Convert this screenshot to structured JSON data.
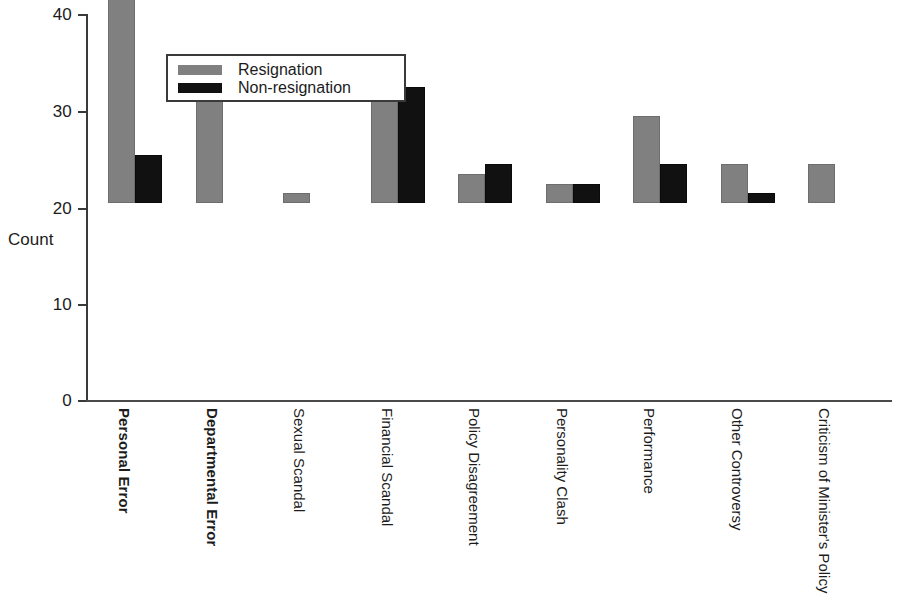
{
  "chart_data": {
    "type": "bar",
    "title": "",
    "xlabel": "",
    "ylabel": "Count",
    "ylim": [
      0,
      40
    ],
    "yticks": [
      0,
      10,
      20,
      30,
      40
    ],
    "grid": false,
    "legend_position": "top-left-inside",
    "categories": [
      "Personal Error",
      "Departmental Error",
      "Sexual Scandal",
      "Financial Scandal",
      "Policy Disagreement",
      "Personality Clash",
      "Performance",
      "Other Controversy",
      "Criticism of Minister's Policy"
    ],
    "series": [
      {
        "name": "Resignation",
        "color": "#808080",
        "values": [
          35,
          12,
          1,
          14,
          3,
          2,
          9,
          4,
          4
        ]
      },
      {
        "name": "Non-resignation",
        "color": "#111111",
        "values": [
          5,
          0,
          0,
          12,
          4,
          2,
          4,
          1,
          0
        ]
      }
    ]
  },
  "axis": {
    "y_title": "Count",
    "y_tick_labels": [
      "40",
      "30",
      "20",
      "10",
      "0"
    ]
  },
  "legend": {
    "entries": [
      {
        "label": "Resignation",
        "swatch": "resignation"
      },
      {
        "label": "Non-resignation",
        "swatch": "nonresignation"
      }
    ]
  }
}
